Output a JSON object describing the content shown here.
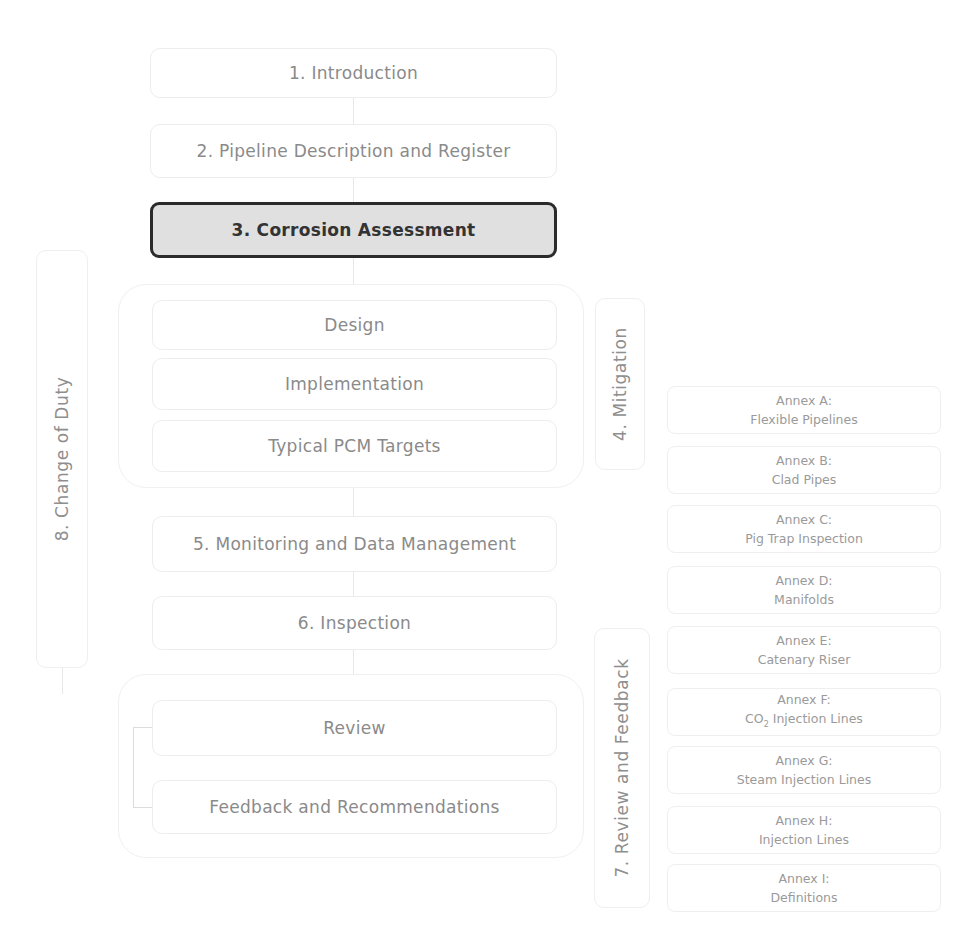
{
  "diagram": {
    "main_steps": [
      {
        "id": "1",
        "label": "1. Introduction"
      },
      {
        "id": "2",
        "label": "2. Pipeline Description and Register"
      },
      {
        "id": "3",
        "label": "3. Corrosion Assessment",
        "active": true
      },
      {
        "id": "5",
        "label": "5. Monitoring and Data Management"
      },
      {
        "id": "6",
        "label": "6. Inspection"
      }
    ],
    "mitigation_group": {
      "label": "4. Mitigation",
      "items": [
        "Design",
        "Implementation",
        "Typical PCM Targets"
      ]
    },
    "review_group": {
      "label": "7. Review and Feedback",
      "items": [
        "Review",
        "Feedback and Recommendations"
      ]
    },
    "change_of_duty": {
      "label": "8. Change of Duty"
    },
    "annexes": [
      {
        "title": "Annex A:",
        "subtitle": "Flexible Pipelines"
      },
      {
        "title": "Annex B:",
        "subtitle": "Clad Pipes"
      },
      {
        "title": "Annex C:",
        "subtitle": "Pig Trap Inspection"
      },
      {
        "title": "Annex D:",
        "subtitle": "Manifolds"
      },
      {
        "title": "Annex E:",
        "subtitle": "Catenary Riser"
      },
      {
        "title": "Annex F:",
        "subtitle_pre": "CO",
        "subtitle_sub": "2",
        "subtitle_post": " Injection Lines"
      },
      {
        "title": "Annex G:",
        "subtitle": "Steam Injection Lines"
      },
      {
        "title": "Annex H:",
        "subtitle": "Injection Lines"
      },
      {
        "title": "Annex I:",
        "subtitle": "Definitions"
      }
    ],
    "colors": {
      "active_fill": "#e0e0e0",
      "active_border": "#2b2b2b",
      "faded_text": "#8a8a8a",
      "faded_border": "#ededed"
    }
  }
}
